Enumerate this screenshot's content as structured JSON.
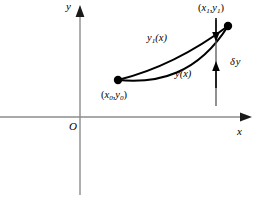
{
  "figure": {
    "background_color": "#ffffff",
    "axis_color": "#8c8c8c",
    "curve_color": "#000000",
    "annotation_color": "#000000",
    "width": 263,
    "height": 206
  },
  "axes": {
    "x_axis_label": "x",
    "y_axis_label": "y",
    "origin_label": "O",
    "x_axis": {
      "x_start": 0,
      "x_end": 252,
      "y": 117,
      "arrow": "right"
    },
    "y_axis": {
      "y_start": 8,
      "y_end": 195,
      "x": 80,
      "arrow": "up"
    }
  },
  "points": {
    "start": {
      "label_plain": "(x0,y0)",
      "x": 118,
      "y": 80
    },
    "end": {
      "label_plain": "(x1,y1)",
      "x": 228,
      "y": 26
    }
  },
  "curves": [
    {
      "name": "upper-curve",
      "label_plain": "y1(x)",
      "path": "M 118 80 C 150 72, 188 56, 228 26"
    },
    {
      "name": "lower-curve",
      "label_plain": "y(x)",
      "path": "M 118 80 C 158 84, 198 74, 228 26"
    }
  ],
  "annotations": {
    "variation": {
      "label_plain": "δ y",
      "symbol": "δ",
      "variable": "y",
      "vertical_line": {
        "x": 216,
        "y_top": 20,
        "y_bottom": 106
      },
      "arrow_top": {
        "x": 216,
        "y_from": 18,
        "y_to": 40,
        "direction": "down"
      },
      "arrow_bottom": {
        "x": 216,
        "y_from": 86,
        "y_to": 62,
        "direction": "up"
      }
    }
  },
  "labels": {
    "y_axis": "y",
    "x_axis": "x",
    "origin": "O",
    "start_open_paren": "(",
    "start_x": "x",
    "start_x_sub": "0",
    "start_comma": ",",
    "start_y": "y",
    "start_y_sub": "0",
    "start_close_paren": ")",
    "end_open_paren": "(",
    "end_x": "x",
    "end_x_sub": "1",
    "end_comma": ",",
    "end_y": "y",
    "end_y_sub": "1",
    "end_close_paren": ")",
    "upper_curve_y": "y",
    "upper_curve_sub": "1",
    "upper_curve_arg": "(x)",
    "lower_curve_y": "y",
    "lower_curve_arg": "(x)",
    "delta_symbol": "δ",
    "delta_variable": "y"
  }
}
